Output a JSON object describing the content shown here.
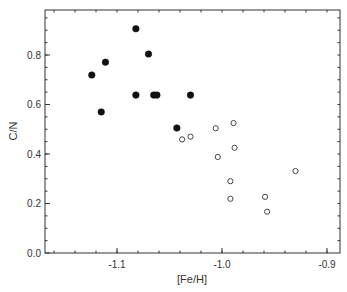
{
  "chart_data": {
    "type": "scatter",
    "title": "",
    "xlabel": "[Fe/H]",
    "ylabel": "C/N",
    "xlim": [
      -1.17,
      -0.88
    ],
    "ylim": [
      0.0,
      1.0
    ],
    "x_ticks": [
      -1.1,
      -1.0,
      -0.9
    ],
    "x_tick_labels": [
      "-1.1",
      "-1.0",
      "-0.9"
    ],
    "y_ticks": [
      0.0,
      0.2,
      0.4,
      0.6,
      0.8
    ],
    "y_tick_labels": [
      "0.0",
      "0.2",
      "0.4",
      "0.6",
      "0.8"
    ],
    "grid": false,
    "legend": null,
    "series": [
      {
        "name": "filled",
        "marker": "filled-circle",
        "color": "#111111",
        "x": [
          -1.082,
          -1.07,
          -1.111,
          -1.124,
          -1.082,
          -1.065,
          -1.062,
          -1.03,
          -1.115,
          -1.043
        ],
        "y": [
          0.906,
          0.804,
          0.771,
          0.719,
          0.638,
          0.638,
          0.638,
          0.638,
          0.57,
          0.505
        ]
      },
      {
        "name": "open",
        "marker": "open-circle",
        "color": "#444444",
        "x": [
          -1.038,
          -1.03,
          -1.006,
          -0.989,
          -0.988,
          -1.004,
          -0.93,
          -0.992,
          -0.992,
          -0.959,
          -0.957
        ],
        "y": [
          0.459,
          0.47,
          0.504,
          0.525,
          0.425,
          0.388,
          0.331,
          0.29,
          0.219,
          0.227,
          0.167
        ]
      }
    ]
  }
}
